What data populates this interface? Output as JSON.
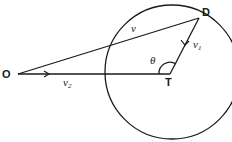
{
  "diagram": {
    "type": "geometry-vector-diagram",
    "points": {
      "O": {
        "label": "O"
      },
      "T": {
        "label": "T"
      },
      "D": {
        "label": "D"
      }
    },
    "vectors": {
      "v": {
        "label": "v",
        "from": "O",
        "to": "D"
      },
      "v1": {
        "label": "v",
        "subscript": "1",
        "from": "D",
        "to": "T"
      },
      "v2": {
        "label": "v",
        "subscript": "2",
        "from": "O",
        "to": "T"
      }
    },
    "angle": {
      "label": "θ",
      "vertex": "T"
    },
    "circle": {
      "center": "T",
      "passes_through": "D"
    },
    "colors": {
      "stroke": "#1a1a1a",
      "background": "#ffffff"
    }
  }
}
